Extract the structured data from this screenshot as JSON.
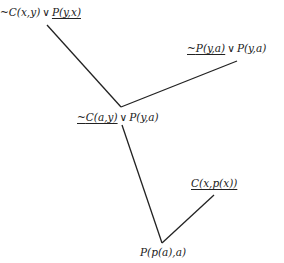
{
  "diagram": {
    "type": "resolution-refutation-tree",
    "nodes": [
      {
        "id": "n1",
        "neg": "~",
        "lit1": "C(x,y)",
        "op": "∨",
        "lit2": "P(y,x)",
        "underline": "lit2"
      },
      {
        "id": "n2",
        "neg": "~",
        "lit1": "P(y,a)",
        "op": "∨",
        "lit2": "P(y,a)",
        "underline": "lit1"
      },
      {
        "id": "n3",
        "neg": "~",
        "lit1": "C(a,y)",
        "op": "∨",
        "lit2": "P(y,a)",
        "underline": "lit1"
      },
      {
        "id": "n4",
        "lit1": "C(x,p(x))",
        "underline": "lit1"
      },
      {
        "id": "n5",
        "lit1": "P(p(a),a)"
      }
    ],
    "edges": [
      {
        "from": "n1",
        "to": "n3"
      },
      {
        "from": "n2",
        "to": "n3"
      },
      {
        "from": "n3",
        "to": "n5"
      },
      {
        "from": "n4",
        "to": "n5"
      }
    ],
    "line_color": "#222222"
  }
}
